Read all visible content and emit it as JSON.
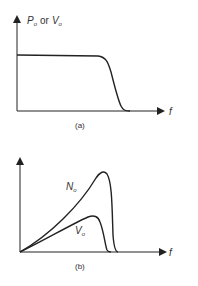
{
  "figure_a": {
    "caption": "(a)",
    "y_label": {
      "p": "P",
      "p_sub": "o",
      "or": "or",
      "v": "V",
      "v_sub": "o"
    },
    "x_label": "f"
  },
  "figure_b": {
    "caption": "(b)",
    "x_label": "f",
    "curve_labels": [
      {
        "main": "N",
        "sub": "o"
      },
      {
        "main": "V",
        "sub": "o"
      }
    ]
  },
  "colors": {
    "stroke": "#222222",
    "text": "#333333"
  }
}
